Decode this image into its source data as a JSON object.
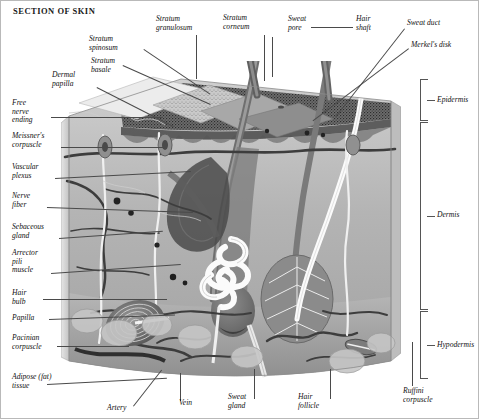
{
  "plate": {
    "title": "SECTION OF SKIN",
    "border_color": "#b9b9b9",
    "background": "#ffffff",
    "ink_color": "#111111",
    "leader_color": "#4a4a4a",
    "style": "grayscale anatomical illustration, italic serif callout labels"
  },
  "labels": {
    "stratum_granulosum": "Stratum\ngranulosum",
    "stratum_corneum": "Stratum\ncorneum",
    "sweat_pore": "Sweat\npore",
    "hair_shaft": "Hair\nshaft",
    "sweat_duct": "Sweat duct",
    "merkels_disk": "Merkel's disk",
    "stratum_spinosum": "Stratum\nspinosum",
    "stratum_basale": "Stratum\nbasale",
    "dermal_papilla": "Dermal\npapilla",
    "free_nerve_ending": "Free\nnerve\nending",
    "meissners_corpuscle": "Meissner's\ncorpuscle",
    "vascular_plexus": "Vascular\nplexus",
    "nerve_fiber": "Nerve\nfiber",
    "sebaceous_gland": "Sebaceous\ngland",
    "arrector_pili_muscle": "Arrector\npili\nmuscle",
    "hair_bulb": "Hair\nbulb",
    "papilla": "Papilla",
    "pacinian_corpuscle": "Pacinian\ncorpuscle",
    "adipose_tissue": "Adipose (fat)\ntissue",
    "artery": "Artery",
    "vein": "Vein",
    "sweat_gland": "Sweat\ngland",
    "hair_follicle": "Hair\nfollicle",
    "ruffini_corpuscle": "Ruffini\ncorpuscle"
  },
  "layer_brackets": [
    {
      "name": "Epidermis"
    },
    {
      "name": "Dermis"
    },
    {
      "name": "Hypodermis"
    }
  ]
}
